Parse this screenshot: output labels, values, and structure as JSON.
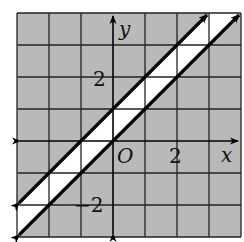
{
  "figure": {
    "type": "coordinate-plane-inequality",
    "grid": {
      "x_min": -3,
      "x_max": 4,
      "y_min": -3,
      "y_max": 4,
      "step": 1
    },
    "colors": {
      "shade": "#b9b9b9",
      "strip": "#ffffff",
      "grid": "#222222",
      "line": "#000000"
    },
    "axes": {
      "x_label": "x",
      "y_label": "y",
      "origin_label": "O"
    },
    "tick_labels": [
      {
        "axis": "y",
        "value": 2,
        "text": "2"
      },
      {
        "axis": "x",
        "value": 2,
        "text": "2"
      },
      {
        "axis": "y",
        "value": -2,
        "text": "−2"
      }
    ],
    "boundary_lines": [
      {
        "equation": "y = x + 1",
        "style": "solid",
        "arrows": "both"
      },
      {
        "equation": "y = x",
        "style": "solid",
        "arrows": "both"
      }
    ],
    "unshaded_region": "x < y < x + 1 (between the two lines)",
    "shaded_region": "y > x + 1 or y < x"
  }
}
